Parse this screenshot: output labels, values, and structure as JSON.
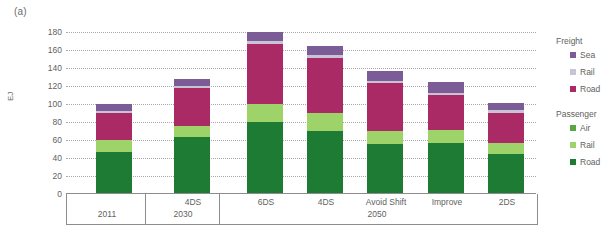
{
  "panel_label": "(a)",
  "axis": {
    "ylabel": "EJ",
    "yticks": [
      "0",
      "20",
      "40",
      "60",
      "80",
      "100",
      "120",
      "140",
      "160",
      "180"
    ]
  },
  "legend": {
    "groups": [
      {
        "title": "Freight",
        "items": [
          {
            "label": "Sea",
            "color": "#7b5c96"
          },
          {
            "label": "Rail",
            "color": "#c9c3d6"
          },
          {
            "label": "Road",
            "color": "#a92a64"
          }
        ]
      },
      {
        "title": "Passenger",
        "items": [
          {
            "label": "Air",
            "color": "#5aa843"
          },
          {
            "label": "Rail",
            "color": "#9ed36a"
          },
          {
            "label": "Road",
            "color": "#1e7b33"
          }
        ]
      }
    ]
  },
  "groups": [
    {
      "label": "2011",
      "categories": [
        "2011"
      ]
    },
    {
      "label": "2030",
      "categories": [
        "4DS"
      ]
    },
    {
      "label": "2050",
      "categories": [
        "6DS",
        "4DS",
        "Avoid Shift",
        "Improve",
        "2DS"
      ]
    }
  ],
  "chart_data": {
    "type": "bar",
    "stacked": true,
    "title": "",
    "subtitle": "",
    "xlabel": "",
    "ylabel": "EJ",
    "ylim": [
      0,
      180
    ],
    "ytick_step": 20,
    "grid": true,
    "legend_position": "right",
    "categories": [
      "2011",
      "4DS",
      "6DS",
      "4DS",
      "Avoid Shift",
      "Improve",
      "2DS"
    ],
    "category_groups": [
      "2011",
      "2030",
      "2050",
      "2050",
      "2050",
      "2050",
      "2050"
    ],
    "series": [
      {
        "name": "Passenger Road",
        "color": "#1e7b33",
        "values": [
          47,
          63,
          80,
          70,
          56,
          57,
          44
        ]
      },
      {
        "name": "Passenger Rail",
        "color": "#9ed36a",
        "values": [
          13,
          13,
          20,
          20,
          14,
          14,
          13
        ]
      },
      {
        "name": "Passenger Air",
        "color": "#5aa843",
        "values": [
          0,
          0,
          0,
          0,
          0,
          0,
          0
        ]
      },
      {
        "name": "Freight Road",
        "color": "#a92a64",
        "values": [
          30,
          42,
          67,
          61,
          53,
          39,
          33
        ]
      },
      {
        "name": "Freight Rail",
        "color": "#c9c3d6",
        "values": [
          2,
          2,
          3,
          3,
          3,
          2,
          3
        ]
      },
      {
        "name": "Freight Sea",
        "color": "#7b5c96",
        "values": [
          8,
          8,
          10,
          11,
          11,
          12,
          8
        ]
      }
    ],
    "totals": [
      100,
      128,
      180,
      165,
      137,
      124,
      101
    ]
  }
}
